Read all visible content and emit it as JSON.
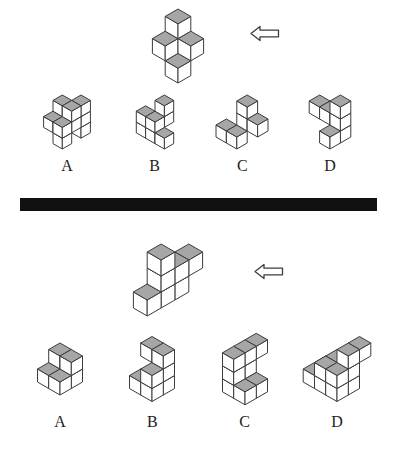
{
  "colors": {
    "top_shade": "#a6a6a6",
    "face": "#ffffff",
    "outline": "#3c3c3c",
    "divider": "#111111",
    "background": "#ffffff"
  },
  "puzzles": [
    {
      "name": "cube-rotation-question-1",
      "arrow": {
        "icon": "left-arrow",
        "direction": "left"
      },
      "target": {
        "description": "isometric-cube-assembly",
        "cubes": [
          [
            0,
            0,
            1
          ],
          [
            0,
            1,
            1
          ],
          [
            1,
            0,
            1
          ],
          [
            1,
            1,
            0
          ],
          [
            0,
            0,
            2
          ]
        ]
      },
      "options": [
        {
          "label": "A",
          "cubes": [
            [
              1,
              -1,
              0
            ],
            [
              1,
              -1,
              1
            ],
            [
              0,
              0,
              1
            ],
            [
              1,
              0,
              1
            ],
            [
              0,
              1,
              1
            ],
            [
              1,
              1,
              1
            ],
            [
              1,
              1,
              0
            ],
            [
              0,
              0,
              2
            ],
            [
              1,
              0,
              2
            ],
            [
              1,
              -1,
              2
            ]
          ]
        },
        {
          "label": "B",
          "cubes": [
            [
              0,
              0,
              0
            ],
            [
              1,
              0,
              0
            ],
            [
              2,
              0,
              0
            ],
            [
              0,
              0,
              1
            ],
            [
              1,
              0,
              1
            ],
            [
              1,
              -1,
              1
            ],
            [
              1,
              -1,
              2
            ]
          ]
        },
        {
          "label": "C",
          "cubes": [
            [
              -1,
              1,
              0
            ],
            [
              0,
              1,
              0
            ],
            [
              0,
              0,
              1
            ],
            [
              1,
              0,
              1
            ],
            [
              0,
              0,
              2
            ]
          ]
        },
        {
          "label": "D",
          "cubes": [
            [
              0,
              0,
              1
            ],
            [
              1,
              0,
              1
            ],
            [
              2,
              0,
              0
            ],
            [
              2,
              0,
              1
            ],
            [
              2,
              1,
              0
            ],
            [
              2,
              0,
              2
            ]
          ]
        }
      ]
    },
    {
      "name": "cube-rotation-question-2",
      "arrow": {
        "icon": "left-arrow",
        "direction": "left"
      },
      "target": {
        "description": "isometric-block-assembly",
        "cubes": [
          [
            1,
            0,
            0
          ],
          [
            1,
            1,
            0
          ],
          [
            1,
            2,
            0
          ],
          [
            1,
            -1,
            1
          ],
          [
            1,
            0,
            1
          ],
          [
            1,
            1,
            1
          ],
          [
            1,
            1,
            2
          ]
        ]
      },
      "options": [
        {
          "label": "A",
          "cubes": [
            [
              0,
              0,
              0
            ],
            [
              1,
              0,
              0
            ],
            [
              0,
              1,
              0
            ],
            [
              1,
              1,
              0
            ],
            [
              0,
              0,
              1
            ],
            [
              1,
              0,
              1
            ]
          ]
        },
        {
          "label": "B",
          "cubes": [
            [
              0,
              1,
              0
            ],
            [
              1,
              1,
              0
            ],
            [
              1,
              0,
              0
            ],
            [
              1,
              0,
              1
            ],
            [
              1,
              1,
              1
            ],
            [
              0,
              0,
              2
            ],
            [
              1,
              0,
              2
            ]
          ]
        },
        {
          "label": "C",
          "cubes": [
            [
              0,
              0,
              0
            ],
            [
              0,
              1,
              0
            ],
            [
              1,
              0,
              0
            ],
            [
              1,
              1,
              0
            ],
            [
              0,
              0,
              1
            ],
            [
              0,
              1,
              1
            ],
            [
              0,
              -1,
              2
            ],
            [
              0,
              0,
              2
            ],
            [
              0,
              1,
              2
            ]
          ]
        },
        {
          "label": "D",
          "cubes": [
            [
              0,
              0,
              0
            ],
            [
              0,
              1,
              0
            ],
            [
              1,
              0,
              0
            ],
            [
              1,
              1,
              0
            ],
            [
              1,
              0,
              1
            ],
            [
              1,
              1,
              1
            ],
            [
              2,
              0,
              0
            ],
            [
              2,
              1,
              0
            ],
            [
              2,
              0,
              1
            ],
            [
              2,
              1,
              1
            ],
            [
              2,
              0,
              2
            ],
            [
              2,
              -1,
              2
            ]
          ]
        }
      ]
    }
  ]
}
